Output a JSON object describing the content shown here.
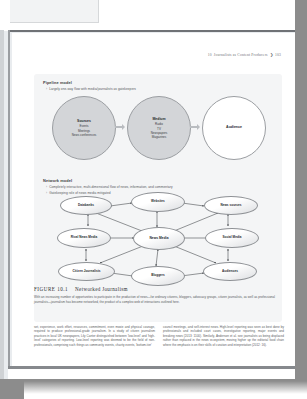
{
  "running_head": {
    "chapter_number": "10",
    "title": "Journalists as Content Producers",
    "arrow": "❯",
    "page_number": "103"
  },
  "figure": {
    "pipeline": {
      "heading": "Pipeline model",
      "bullets": [
        "Largely one-way flow with media/journalists as gatekeepers"
      ],
      "nodes": [
        {
          "title": "Sources",
          "lines": [
            "Events",
            "Meetings",
            "News conferences"
          ],
          "style": "shaded"
        },
        {
          "title": "Medium",
          "lines": [
            "Radio",
            "TV",
            "Newspapers",
            "Magazines"
          ],
          "style": "shaded"
        },
        {
          "title": "Audience",
          "lines": [],
          "style": "plain"
        }
      ]
    },
    "network": {
      "heading": "Network model",
      "bullets": [
        "Completely interactive, multi-dimensional flow of news, information, and commentary",
        "Gatekeeping role of news media mitigated"
      ],
      "nodes": [
        "Databanks",
        "Websites",
        "News sources",
        "Rival News Media",
        "News Media",
        "Social Media",
        "Citizen Journalists",
        "Bloggers",
        "Audiences"
      ]
    }
  },
  "caption": {
    "label": "FIGURE 10.1",
    "title": "Networked Journalism",
    "body": "With an increasing number of opportunities to participate in the production of news—for ordinary citizens, bloggers, advocacy groups, citizen journalists, as well as professional journalists—journalism has become networked, the product of a complex web of interactions outlined here."
  },
  "body_text": {
    "left_column": "set, experience, work effort, resources, commitment, even moxie and physical courage, required to produce professional-grade journalism. In a study of citizen journalism practices in local UK newspapers, Lily Canter distinguished between 'low-level' and 'high-level' categories of reporting. Low-level reporting was deemed to be the field of non-professionals, comprising such things as community events, charity events, 'bottom-tier'",
    "right_column": "council meetings, and self-interest news. High-level reporting was seen as best done by professionals and included court cases, investigative reporting, major events and breaking news (2013: 1100). Similarly, Anderson et al. see journalists as being displaced rather than replaced in the news ecosystem, moving higher up the editorial food chain where the emphasis is on their skills of curation and interpretation (2012: 16)."
  }
}
